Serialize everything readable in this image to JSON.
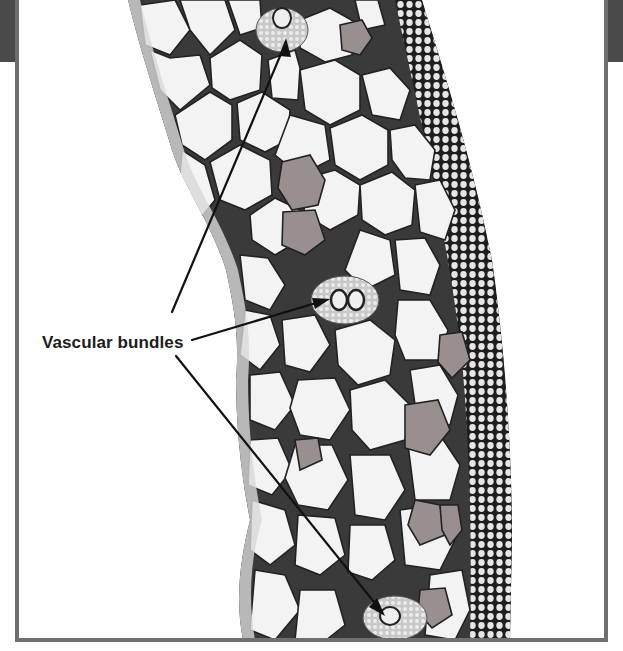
{
  "figure": {
    "label": "Vascular bundles",
    "colors": {
      "frame": "#6f6f6f",
      "corner_tab": "#4a4a4a",
      "cell_fill": "#f2f2f2",
      "cell_wall": "#2a2a2a",
      "stained_cell": "#9a8f8f",
      "arrow": "#111111"
    },
    "arrows": [
      {
        "target": "upper-vascular-bundle",
        "from": [
          172,
          312
        ],
        "to": [
          286,
          42
        ]
      },
      {
        "target": "middle-vascular-bundle",
        "from": [
          192,
          340
        ],
        "to": [
          326,
          300
        ]
      },
      {
        "target": "lower-vascular-bundle",
        "from": [
          176,
          356
        ],
        "to": [
          382,
          612
        ]
      }
    ]
  }
}
